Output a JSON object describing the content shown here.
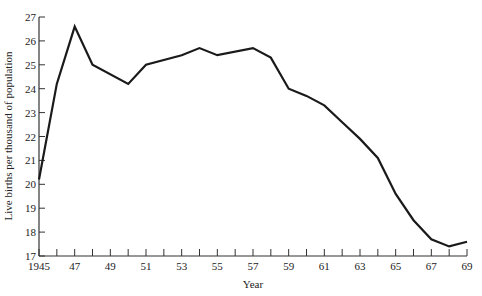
{
  "chart_data": {
    "type": "line",
    "title": "",
    "xlabel": "Year",
    "ylabel": "Live births per thousand of population",
    "xlim": [
      1945,
      1969
    ],
    "ylim": [
      17,
      27
    ],
    "grid": false,
    "legend": null,
    "x_tick_labels": [
      "1945",
      "47",
      "49",
      "51",
      "53",
      "55",
      "57",
      "59",
      "61",
      "63",
      "65",
      "67",
      "69"
    ],
    "x_tick_values": [
      1945,
      1947,
      1949,
      1951,
      1953,
      1955,
      1957,
      1959,
      1961,
      1963,
      1965,
      1967,
      1969
    ],
    "x_minor_ticks": [
      1946,
      1948,
      1950,
      1952,
      1954,
      1956,
      1958,
      1960,
      1962,
      1964,
      1966,
      1968
    ],
    "y_tick_labels": [
      "17",
      "18",
      "19",
      "20",
      "21",
      "22",
      "23",
      "24",
      "25",
      "26",
      "27"
    ],
    "y_tick_values": [
      17,
      18,
      19,
      20,
      21,
      22,
      23,
      24,
      25,
      26,
      27
    ],
    "series": [
      {
        "name": "Birth rate",
        "color": "#1a1a1a",
        "x": [
          1945,
          1946,
          1947,
          1948,
          1950,
          1951,
          1953,
          1954,
          1955,
          1957,
          1958,
          1959,
          1960,
          1961,
          1962,
          1963,
          1964,
          1965,
          1966,
          1967,
          1968,
          1969
        ],
        "values": [
          20.2,
          24.2,
          26.6,
          25.0,
          24.2,
          25.0,
          25.4,
          25.7,
          25.4,
          25.7,
          25.3,
          24.0,
          23.7,
          23.3,
          22.6,
          21.9,
          21.1,
          19.6,
          18.5,
          17.7,
          17.4,
          17.6
        ]
      }
    ]
  },
  "axes": {
    "x_title": "Year",
    "y_title": "Live births per thousand of population"
  }
}
